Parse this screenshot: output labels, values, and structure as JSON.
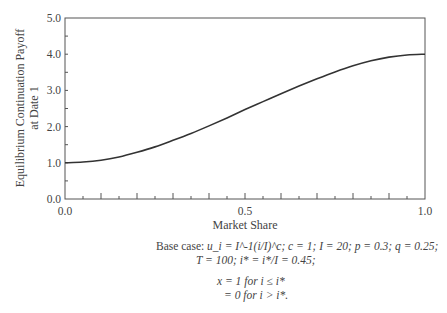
{
  "chart_data": {
    "type": "line",
    "title": "",
    "xlabel": "Market Share",
    "ylabel": [
      "Equilibrium Continuation Payoff",
      "at Date 1"
    ],
    "xlim": [
      0.0,
      1.0
    ],
    "ylim": [
      0.0,
      5.0
    ],
    "x_ticks": [
      "0.0",
      "0.5",
      "1.0"
    ],
    "x_tick_values": [
      0.0,
      0.5,
      1.0
    ],
    "x_minor_tick_step": 0.05,
    "y_ticks": [
      "0.0",
      "1.0",
      "2.0",
      "3.0",
      "4.0",
      "5.0"
    ],
    "y_tick_values": [
      0,
      1,
      2,
      3,
      4,
      5
    ],
    "y_minor_tick_step": 0.5,
    "grid": false,
    "series": [
      {
        "name": "Equilibrium continuation payoff",
        "x": [
          0.0,
          0.05,
          0.1,
          0.15,
          0.2,
          0.25,
          0.3,
          0.35,
          0.4,
          0.45,
          0.5,
          0.55,
          0.6,
          0.65,
          0.7,
          0.75,
          0.8,
          0.85,
          0.9,
          0.95,
          1.0
        ],
        "y": [
          1.0,
          1.02,
          1.07,
          1.16,
          1.29,
          1.44,
          1.62,
          1.81,
          2.02,
          2.24,
          2.47,
          2.69,
          2.91,
          3.12,
          3.32,
          3.51,
          3.68,
          3.82,
          3.92,
          3.98,
          4.0
        ]
      }
    ]
  },
  "caption": {
    "line1_prefix": "Base case: ",
    "line1": "u_i = I^-1(i/I)^c; c = 1; I = 20; p = 0.3; q = 0.25;",
    "line2": "T = 100; i* = i*/I = 0.45;",
    "line3": "x = 1 for i ≤ i*",
    "line4": "= 0 for i > i*."
  }
}
